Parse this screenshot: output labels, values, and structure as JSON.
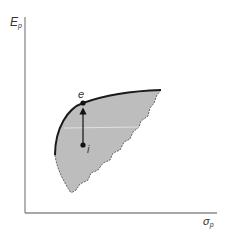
{
  "diagram": {
    "type": "efficient-frontier",
    "y_axis": {
      "symbol": "E",
      "subscript": "p"
    },
    "x_axis": {
      "symbol": "σ",
      "subscript": "p"
    },
    "points": [
      {
        "id": "e",
        "label": "e",
        "description": "portfolio on efficient frontier"
      },
      {
        "id": "i",
        "label": "i",
        "description": "inefficient portfolio inside feasible set"
      }
    ],
    "arrow": {
      "from": "i",
      "to": "e"
    },
    "colors": {
      "feasible_region": "#bdbdbd",
      "frontier": "#1a1a1a",
      "axes": "#8a8a8a",
      "points": "#111111"
    }
  }
}
